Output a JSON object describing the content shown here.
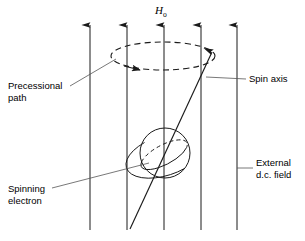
{
  "figure": {
    "title_symbol": {
      "base": "H",
      "subscript": "o"
    },
    "labels": {
      "precessional_path_line1": "Precessional",
      "precessional_path_line2": "path",
      "spinning_electron_line1": "Spinning",
      "spinning_electron_line2": "electron",
      "spin_axis": "Spin axis",
      "external_field_line1": "External",
      "external_field_line2": "d.c. field"
    },
    "colors": {
      "stroke": "#1a1a1a",
      "leader": "#555555",
      "background": "#ffffff"
    },
    "elements": {
      "field_line_count": 5,
      "precession_direction": "clockwise-viewed-from-above",
      "sphere_name": "spinning electron",
      "axis_name": "spin axis"
    }
  }
}
